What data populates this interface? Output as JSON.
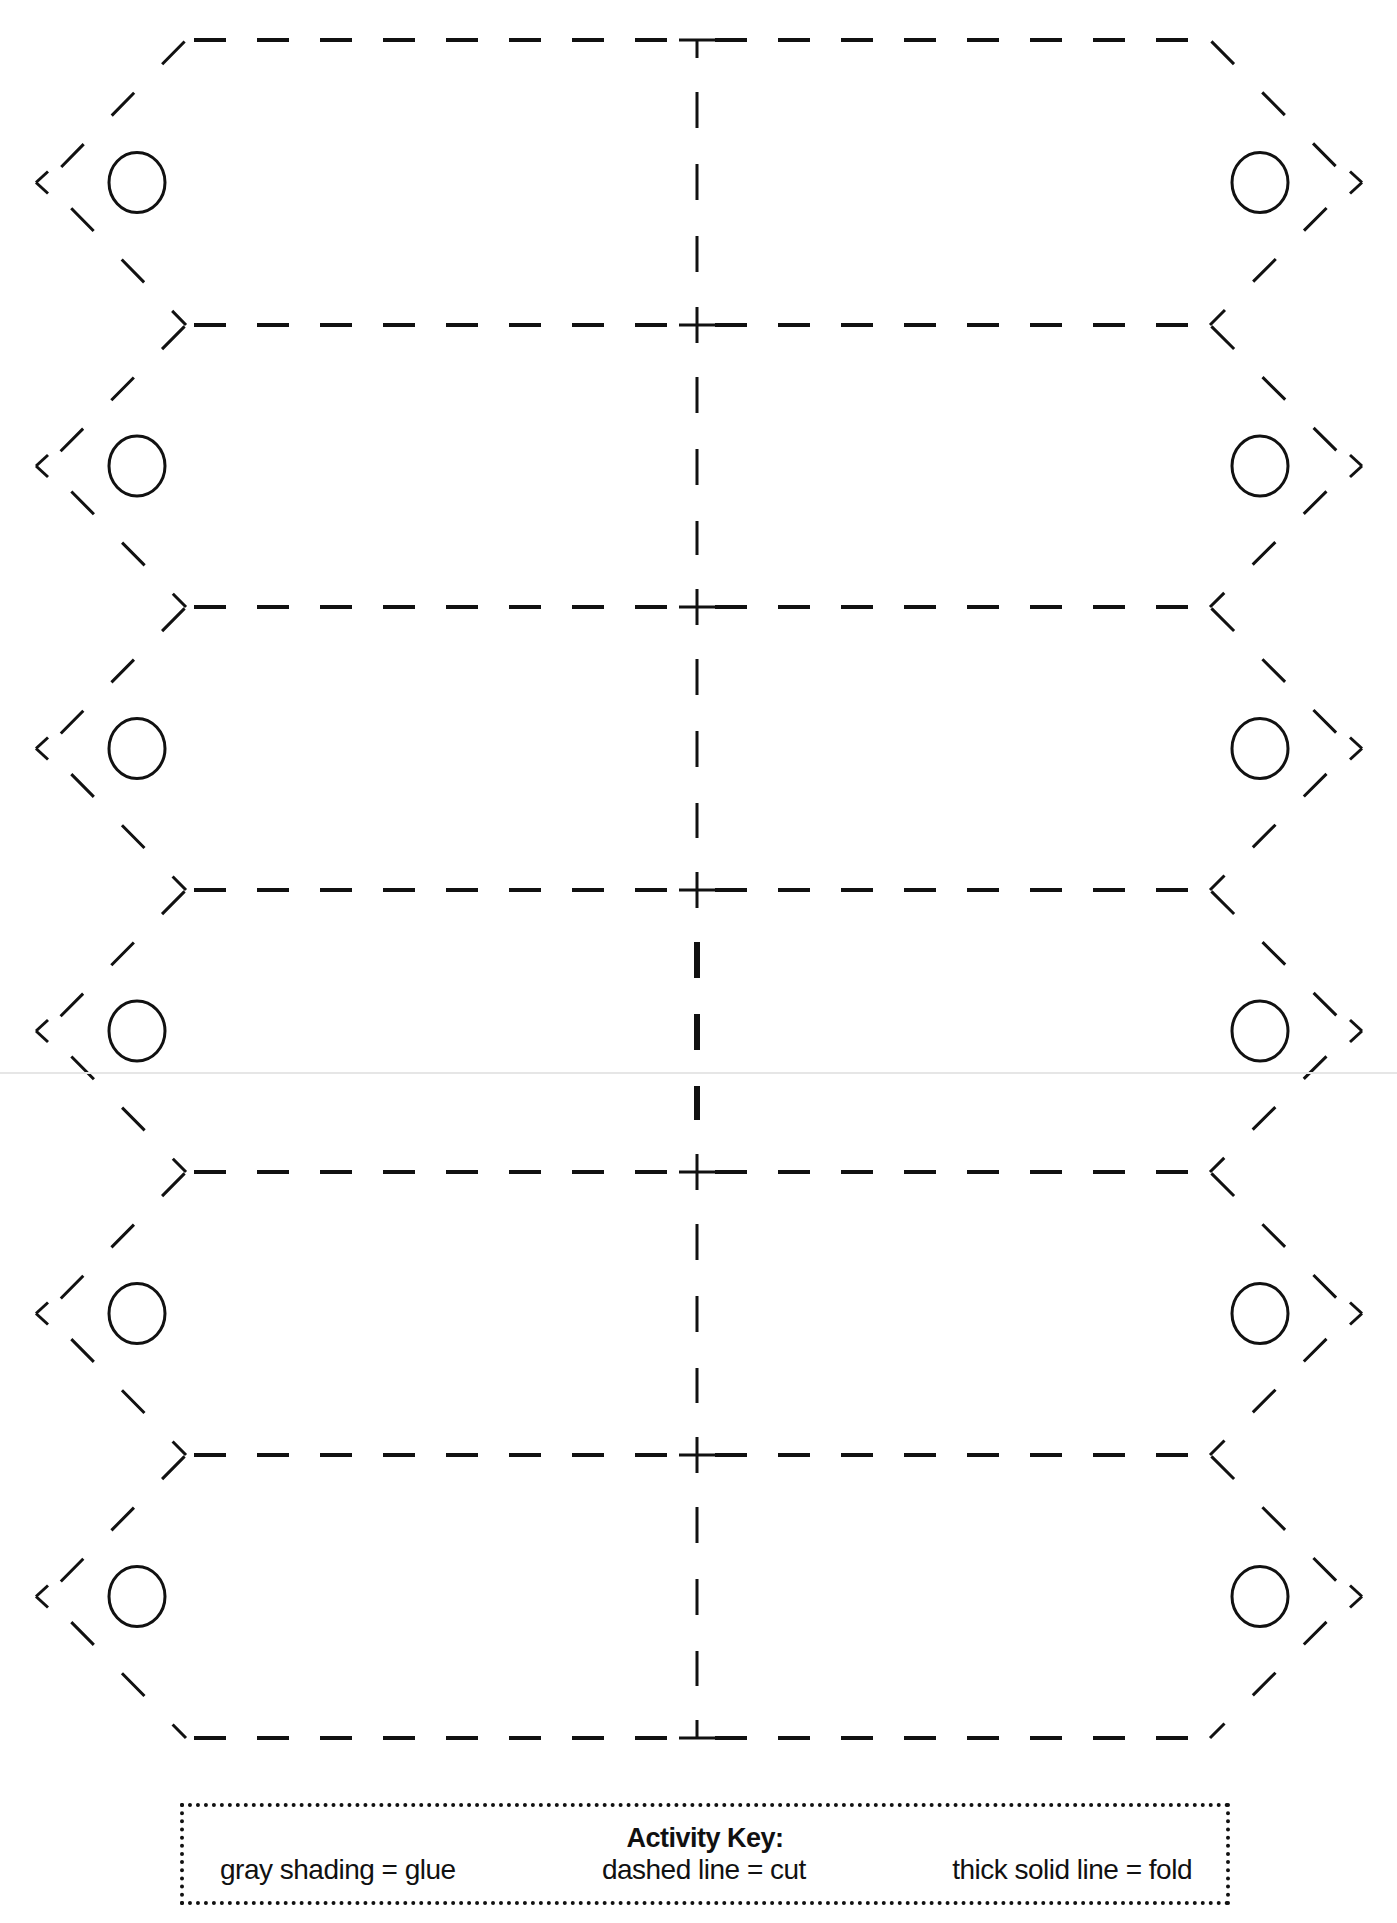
{
  "document": {
    "type": "printable cut-out tag template",
    "tag_rows": 6,
    "tag_columns": 2,
    "line_color": "#111111",
    "background": "#ffffff"
  },
  "activity_key": {
    "title": "Activity Key:",
    "items": [
      {
        "label": "gray shading = glue"
      },
      {
        "label": "dashed line = cut"
      },
      {
        "label": "thick solid line = fold"
      }
    ]
  },
  "geometry": {
    "horizontal_lines_y": [
      40,
      325,
      607,
      890,
      1172,
      1455,
      1738
    ],
    "left_point_x": 36,
    "right_point_x": 1362,
    "shoulder_left_x": 186,
    "shoulder_right_x": 1210,
    "center_x": 697,
    "circle_left_cx": 137,
    "circle_right_cx": 1260,
    "circle_rx": 28,
    "circle_ry": 30,
    "fold_segment_rows": [
      3
    ]
  }
}
